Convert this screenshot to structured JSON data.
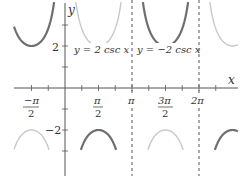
{
  "chart_data": {
    "type": "line",
    "title": "",
    "xlabel": "x",
    "ylabel": "y",
    "xlim": [
      -1.93,
      2.49
    ],
    "xlim_note": "in units of pi: approx -0.97pi to 2.25pi",
    "ylim": [
      -3.0,
      4.2
    ],
    "grid": false,
    "x_ticks": [
      {
        "value": "-pi/2",
        "label_num": "−π",
        "label_den": "2"
      },
      {
        "value": "pi/2",
        "label_num": "π",
        "label_den": "2"
      },
      {
        "value": "pi",
        "label": "π"
      },
      {
        "value": "3pi/2",
        "label_num": "3π",
        "label_den": "2"
      },
      {
        "value": "2pi",
        "label": "2π"
      }
    ],
    "y_ticks": [
      {
        "value": 2,
        "label": "2"
      },
      {
        "value": -2,
        "label": "−2"
      }
    ],
    "asymptotes": [
      {
        "x": "pi",
        "style": "dashed"
      },
      {
        "x": "2pi",
        "style": "dashed"
      }
    ],
    "series": [
      {
        "name": "y = 2 csc x",
        "color": "#c8c8c8",
        "function": "2/sin(x)",
        "branches": [
          {
            "interval": "(0, pi)",
            "shape": "U",
            "extremum": {
              "x": "pi/2",
              "y": 2
            }
          },
          {
            "interval": "(pi, 2pi)",
            "shape": "cap",
            "extremum": {
              "x": "3pi/2",
              "y": -2
            }
          },
          {
            "interval": "(-pi, 0)",
            "shape": "cap",
            "extremum": {
              "x": "-pi/2",
              "y": -2
            }
          },
          {
            "interval": "(2pi, 3pi)",
            "shape": "U (partial)"
          }
        ]
      },
      {
        "name": "y = −2 csc x",
        "color": "#6e6e6e",
        "function": "-2/sin(x)",
        "branches": [
          {
            "interval": "(-pi, 0)",
            "shape": "U",
            "extremum": {
              "x": "-pi/2",
              "y": 2
            }
          },
          {
            "interval": "(0, pi)",
            "shape": "cap",
            "extremum": {
              "x": "pi/2",
              "y": -2
            }
          },
          {
            "interval": "(pi, 2pi)",
            "shape": "U",
            "extremum": {
              "x": "3pi/2",
              "y": 2
            }
          },
          {
            "interval": "(2pi, 3pi)",
            "shape": "cap (partial)"
          }
        ]
      }
    ],
    "annotations": [
      {
        "text": "y = 2 csc x",
        "near": "x≈pi/2, y≈2"
      },
      {
        "text": "y = −2 csc x",
        "near": "x≈3pi/2, y≈2"
      }
    ]
  },
  "labels": {
    "x_axis": "x",
    "y_axis": "y",
    "series1": "y = 2 csc x",
    "series2": "y = −2 csc x",
    "y2": "2",
    "ym2": "−2",
    "xm_pi2_num": "−π",
    "xm_pi2_den": "2",
    "x_pi2_num": "π",
    "x_pi2_den": "2",
    "x_pi": "π",
    "x_3pi2_num": "3π",
    "x_3pi2_den": "2",
    "x_2pi": "2π"
  }
}
